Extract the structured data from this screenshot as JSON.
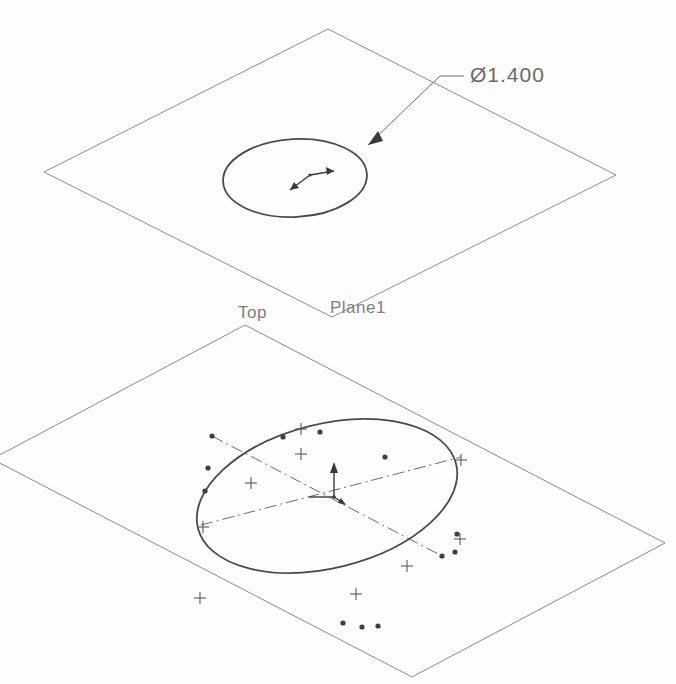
{
  "view": {
    "background_color": "#fdfdfd",
    "line_color": "#8a8a8a",
    "sketch_color": "#4a4a4a",
    "text_color": "#7d7d7d"
  },
  "dimension": {
    "label": "Ø1.400",
    "value": "1.400",
    "symbol": "Ø",
    "type": "diameter"
  },
  "planes": [
    {
      "name": "Plane1",
      "label": "Plane1",
      "sketch": "circle",
      "corners": "328,29 616,175 332,317 44,172"
    },
    {
      "name": "Top",
      "label": "Top",
      "sketch": "spline-ellipse",
      "corners": "245,325 665,543 412,677 -8,459"
    }
  ],
  "annotations": {
    "origin_marker_count": "2",
    "control_point_count": "14",
    "plus_mark_count": "7",
    "construction_line_count": "2"
  }
}
